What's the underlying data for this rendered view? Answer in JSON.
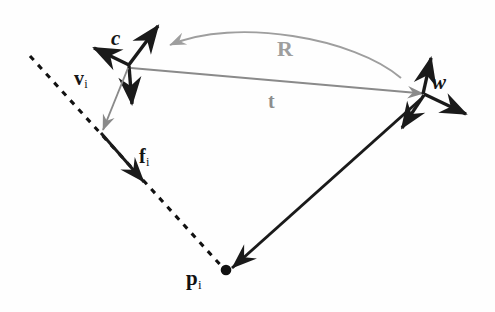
{
  "figure": {
    "background_color": "#fefefe",
    "width": 495,
    "height": 312
  },
  "colors": {
    "ink_black": "#1a1a1a",
    "ray_gray": "#8a8a8a",
    "rotation_gray": "#9e9e9e",
    "translation_gray": "#8d8d8d",
    "dashed_black": "#111111"
  },
  "labels": {
    "camera_origin": "c",
    "world_origin": "w",
    "ray_vector": "v",
    "ray_vector_sub": "i",
    "feature_vector": "f",
    "feature_vector_sub": "i",
    "point": "p",
    "point_sub": "i",
    "translation": "t",
    "rotation": "R"
  },
  "geometry": {
    "camera_frame": {
      "origin": [
        128,
        65
      ],
      "axes": [
        {
          "name": "axis-up-right",
          "to": [
            159,
            24
          ]
        },
        {
          "name": "axis-left",
          "to": [
            90,
            47
          ]
        },
        {
          "name": "axis-down",
          "to": [
            132,
            108
          ]
        }
      ]
    },
    "world_frame": {
      "origin": [
        424,
        93
      ],
      "axes": [
        {
          "name": "axis-up",
          "to": [
            432,
            54
          ]
        },
        {
          "name": "axis-right-down",
          "to": [
            470,
            117
          ]
        },
        {
          "name": "axis-down-left",
          "to": [
            399,
            133
          ]
        }
      ]
    },
    "dashed_ray": {
      "from": [
        30,
        56
      ],
      "to": [
        225,
        270
      ]
    },
    "v_arrow": {
      "from": [
        128,
        67
      ],
      "to": [
        102,
        133
      ]
    },
    "f_arrow": {
      "from": [
        101,
        133
      ],
      "to": [
        146,
        185
      ]
    },
    "t_arrow": {
      "from": [
        130,
        68
      ],
      "to": [
        424,
        94
      ]
    },
    "r_arc": {
      "from": [
        400,
        78
      ],
      "to": [
        168,
        46
      ],
      "apex": [
        280,
        28
      ]
    },
    "w_to_p_arrow": {
      "from": [
        421,
        98
      ],
      "to": [
        228,
        272
      ]
    },
    "point_dot": {
      "center": [
        226,
        270
      ],
      "radius": 5
    }
  }
}
